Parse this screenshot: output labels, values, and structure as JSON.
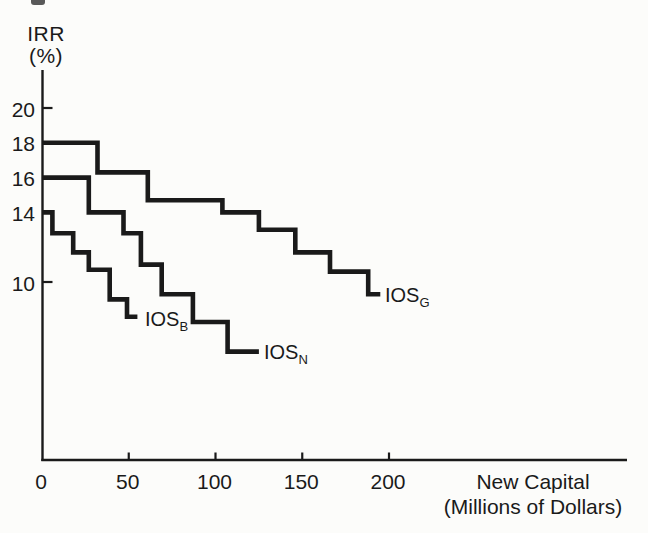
{
  "figure": {
    "y_axis_title_line1": "IRR",
    "y_axis_title_line2": "(%)",
    "x_axis_title_line1": "New Capital",
    "x_axis_title_line2": "(Millions of Dollars)"
  },
  "colors": {
    "ink": "#1a1a1a",
    "paper": "#fcfcfa"
  },
  "chart_data": {
    "type": "line",
    "style": "step-function-schedules",
    "title": "",
    "xlabel": "New Capital (Millions of Dollars)",
    "ylabel": "IRR (%)",
    "xlim": [
      0,
      337
    ],
    "ylim": [
      0,
      22.2
    ],
    "grid": false,
    "legend_position": "inline-at-curve-ends",
    "x_ticks": [
      0,
      50,
      100,
      150,
      200
    ],
    "x_tick_marks": [
      50,
      100,
      150,
      200
    ],
    "y_ticks": [
      20,
      18,
      16,
      14,
      10
    ],
    "y_tick_marks": [
      20,
      10
    ],
    "line_color": "#1a1a1a",
    "series": [
      {
        "id": "ios-g",
        "name": "IOS_G",
        "label": "IOS",
        "subscript": "G",
        "steps": [
          {
            "irr": 18.0,
            "from": 0,
            "to": 32
          },
          {
            "irr": 16.3,
            "from": 32,
            "to": 61
          },
          {
            "irr": 14.7,
            "from": 61,
            "to": 104
          },
          {
            "irr": 14.0,
            "from": 104,
            "to": 125
          },
          {
            "irr": 13.0,
            "from": 125,
            "to": 146
          },
          {
            "irr": 11.7,
            "from": 146,
            "to": 166
          },
          {
            "irr": 10.6,
            "from": 166,
            "to": 188
          },
          {
            "irr": 9.3,
            "from": 188,
            "to": 195
          }
        ]
      },
      {
        "id": "ios-n",
        "name": "IOS_N",
        "label": "IOS",
        "subscript": "N",
        "steps": [
          {
            "irr": 16.0,
            "from": 0,
            "to": 27
          },
          {
            "irr": 14.0,
            "from": 27,
            "to": 47
          },
          {
            "irr": 12.8,
            "from": 47,
            "to": 57
          },
          {
            "irr": 11.0,
            "from": 57,
            "to": 69
          },
          {
            "irr": 9.3,
            "from": 69,
            "to": 87
          },
          {
            "irr": 7.7,
            "from": 87,
            "to": 107
          },
          {
            "irr": 6.0,
            "from": 107,
            "to": 125
          }
        ]
      },
      {
        "id": "ios-b",
        "name": "IOS_B",
        "label": "IOS",
        "subscript": "B",
        "steps": [
          {
            "irr": 14.0,
            "from": 0,
            "to": 6
          },
          {
            "irr": 12.8,
            "from": 6,
            "to": 18
          },
          {
            "irr": 11.7,
            "from": 18,
            "to": 27
          },
          {
            "irr": 10.7,
            "from": 27,
            "to": 39
          },
          {
            "irr": 9.0,
            "from": 39,
            "to": 49
          },
          {
            "irr": 8.0,
            "from": 49,
            "to": 55
          }
        ]
      }
    ]
  }
}
